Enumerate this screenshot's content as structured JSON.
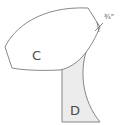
{
  "diagram": {
    "pieces": [
      {
        "id": "C",
        "label": "C",
        "fill": "#ffffff"
      },
      {
        "id": "D",
        "label": "D",
        "fill": "#ececec"
      }
    ],
    "measurement": {
      "label": "3/4\"",
      "display": "¾\""
    },
    "stroke_color": "#7a7a7a"
  }
}
